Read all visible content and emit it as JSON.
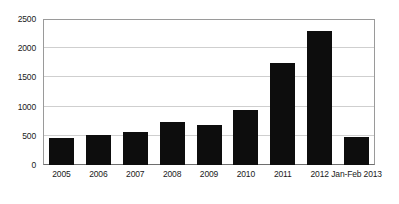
{
  "chart_data": {
    "type": "bar",
    "title": "",
    "subtitle": "",
    "xlabel": "",
    "ylabel": "",
    "categories": [
      "2005",
      "2006",
      "2007",
      "2008",
      "2009",
      "2010",
      "2011",
      "2012",
      "Jan-Feb 2013"
    ],
    "values": [
      460,
      510,
      570,
      740,
      690,
      940,
      1750,
      2290,
      480
    ],
    "series": [
      {
        "name": "",
        "values": [
          460,
          510,
          570,
          740,
          690,
          940,
          1750,
          2290,
          480
        ]
      }
    ],
    "ylim": [
      0,
      2500
    ],
    "ytick_labels": [
      "0",
      "500",
      "1000",
      "1500",
      "2000",
      "2500"
    ],
    "ytick_values": [
      0,
      500,
      1000,
      1500,
      2000,
      2500
    ],
    "grid": true,
    "legend": false,
    "legend_position": "none",
    "bar_color": "#0d0d0d",
    "gridline_color": "#cfcfcf",
    "axis_color": "#9a9a9a",
    "background_color": "#ffffff"
  }
}
